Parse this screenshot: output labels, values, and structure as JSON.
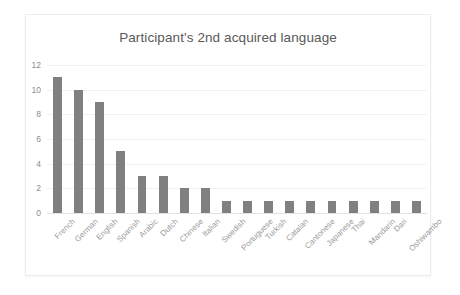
{
  "chart_data": {
    "type": "bar",
    "title": "Participant's 2nd acquired language",
    "xlabel": "",
    "ylabel": "",
    "ylim": [
      0,
      12
    ],
    "yticks": [
      0,
      2,
      4,
      6,
      8,
      10,
      12
    ],
    "grid": true,
    "legend": false,
    "bar_color": "#808080",
    "categories": [
      "French",
      "German",
      "English",
      "Spanish",
      "Arabic",
      "Dutch",
      "Chinese",
      "Italian",
      "Swedish",
      "Portuguese",
      "Turkish",
      "Catalan",
      "Cantonese",
      "Japanese",
      "Thai",
      "Mandarin",
      "Dari",
      "Oshiwambo"
    ],
    "values": [
      11,
      10,
      9,
      5,
      3,
      3,
      2,
      2,
      1,
      1,
      1,
      1,
      1,
      1,
      1,
      1,
      1,
      1
    ]
  }
}
